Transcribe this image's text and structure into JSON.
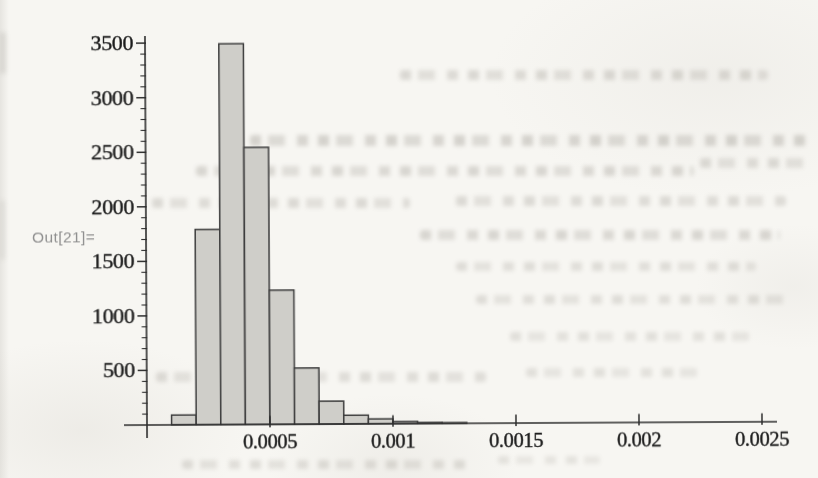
{
  "page": {
    "background_color": "#f7f6f2"
  },
  "output_cell": {
    "label": "Out[21]=",
    "label_color": "#8f8f8f"
  },
  "chart_data": {
    "type": "bar",
    "subtype": "histogram",
    "title": "",
    "xlabel": "",
    "ylabel": "",
    "bins": {
      "start": 0.0001,
      "width": 0.0001
    },
    "values": [
      90,
      1790,
      3490,
      2540,
      1230,
      515,
      210,
      80,
      45,
      20,
      10,
      5
    ],
    "x_tick_values": [
      0.0005,
      0.001,
      0.0015,
      0.002,
      0.0025
    ],
    "x_tick_labels": [
      "0.0005",
      "0.001",
      "0.0015",
      "0.002",
      "0.0025"
    ],
    "y_tick_values": [
      500,
      1000,
      1500,
      2000,
      2500,
      3000,
      3500
    ],
    "y_tick_labels": [
      "500",
      "1000",
      "1500",
      "2000",
      "2500",
      "3000",
      "3500"
    ],
    "y_minor_tick_step": 100,
    "xlim": [
      0,
      0.00256
    ],
    "ylim": [
      0,
      3560
    ],
    "grid": false,
    "legend": null,
    "bar_fill": "#cfcec9",
    "bar_stroke": "#3d3d3d",
    "axis_color": "#2e2e2e",
    "tick_label_color": "#1c1c1c"
  }
}
